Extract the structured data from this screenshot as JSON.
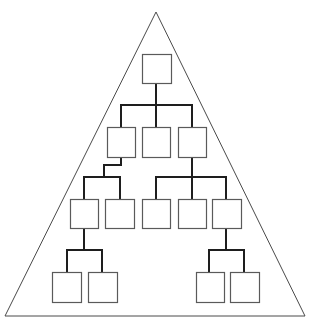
{
  "diagram": {
    "type": "hierarchy-in-triangle",
    "colors": {
      "background": "#ffffff",
      "triangle_stroke": "#4a4a4a",
      "connector_stroke": "#1e1e1e",
      "box_stroke": "#5a5a5a",
      "box_fill": "#ffffff"
    },
    "triangle": {
      "apex": [
        156,
        12
      ],
      "bottom_left": [
        5,
        316
      ],
      "bottom_right": [
        305,
        316
      ]
    },
    "nodes": [
      {
        "id": "root",
        "level": 0,
        "x": 142,
        "y": 54,
        "w": 29,
        "h": 29
      },
      {
        "id": "l1-a",
        "level": 1,
        "x": 107,
        "y": 127,
        "w": 28,
        "h": 30
      },
      {
        "id": "l1-b",
        "level": 1,
        "x": 142,
        "y": 127,
        "w": 28,
        "h": 30
      },
      {
        "id": "l1-c",
        "level": 1,
        "x": 178,
        "y": 127,
        "w": 28,
        "h": 30
      },
      {
        "id": "l2-a",
        "level": 2,
        "x": 70,
        "y": 199,
        "w": 28,
        "h": 29
      },
      {
        "id": "l2-b",
        "level": 2,
        "x": 105,
        "y": 199,
        "w": 29,
        "h": 29
      },
      {
        "id": "l2-c",
        "level": 2,
        "x": 142,
        "y": 199,
        "w": 28,
        "h": 29
      },
      {
        "id": "l2-d",
        "level": 2,
        "x": 178,
        "y": 199,
        "w": 28,
        "h": 29
      },
      {
        "id": "l2-e",
        "level": 2,
        "x": 212,
        "y": 199,
        "w": 29,
        "h": 29
      },
      {
        "id": "l3-a",
        "level": 3,
        "x": 52,
        "y": 272,
        "w": 29,
        "h": 30
      },
      {
        "id": "l3-b",
        "level": 3,
        "x": 88,
        "y": 272,
        "w": 29,
        "h": 30
      },
      {
        "id": "l3-c",
        "level": 3,
        "x": 196,
        "y": 272,
        "w": 28,
        "h": 30
      },
      {
        "id": "l3-d",
        "level": 3,
        "x": 230,
        "y": 272,
        "w": 29,
        "h": 30
      }
    ],
    "connectors": [
      {
        "id": "root-to-l1",
        "points": [
          [
            156,
            83
          ],
          [
            156,
            105
          ]
        ]
      },
      {
        "id": "l1-bus",
        "points": [
          [
            121,
            127
          ],
          [
            121,
            105
          ],
          [
            192,
            105
          ],
          [
            192,
            127
          ]
        ]
      },
      {
        "id": "l1-mid-drop",
        "points": [
          [
            156,
            105
          ],
          [
            156,
            127
          ]
        ]
      },
      {
        "id": "l1a-to-l2-jog",
        "points": [
          [
            121,
            157
          ],
          [
            121,
            165
          ],
          [
            104,
            165
          ],
          [
            104,
            177
          ]
        ]
      },
      {
        "id": "l2-left-bus",
        "points": [
          [
            84,
            199
          ],
          [
            84,
            177
          ],
          [
            120,
            177
          ],
          [
            120,
            199
          ]
        ]
      },
      {
        "id": "l1c-to-l2",
        "points": [
          [
            192,
            157
          ],
          [
            192,
            177
          ]
        ]
      },
      {
        "id": "l2-right-bus",
        "points": [
          [
            156,
            199
          ],
          [
            156,
            177
          ],
          [
            226,
            177
          ],
          [
            226,
            199
          ]
        ]
      },
      {
        "id": "l2-right-mid-drop",
        "points": [
          [
            192,
            177
          ],
          [
            192,
            199
          ]
        ]
      },
      {
        "id": "l2a-to-l3",
        "points": [
          [
            84,
            228
          ],
          [
            84,
            250
          ]
        ]
      },
      {
        "id": "l3-left-bus",
        "points": [
          [
            67,
            272
          ],
          [
            67,
            250
          ],
          [
            102,
            250
          ],
          [
            102,
            272
          ]
        ]
      },
      {
        "id": "l2e-to-l3",
        "points": [
          [
            226,
            228
          ],
          [
            226,
            250
          ]
        ]
      },
      {
        "id": "l3-right-bus",
        "points": [
          [
            209,
            272
          ],
          [
            209,
            250
          ],
          [
            244,
            250
          ],
          [
            244,
            272
          ]
        ]
      }
    ]
  }
}
